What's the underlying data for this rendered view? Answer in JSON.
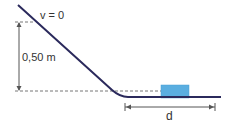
{
  "diagram": {
    "labels": {
      "velocity": "v = 0",
      "height": "0,50 m",
      "distance": "d"
    },
    "colors": {
      "track": "#2b2a5c",
      "block": "#5aaee0",
      "block_border": "#3f95c8",
      "dimension": "#555555",
      "dashed": "#777777"
    }
  }
}
